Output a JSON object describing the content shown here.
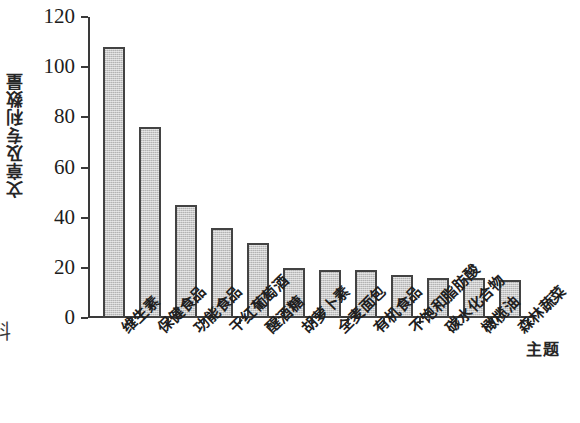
{
  "caption_fragment": "料",
  "chart_data": {
    "type": "bar",
    "title": "",
    "xlabel": "主题",
    "ylabel": "文章及专利数量",
    "ylim": [
      0,
      120
    ],
    "yticks": [
      0,
      20,
      40,
      60,
      80,
      100,
      120
    ],
    "ytick_labels": [
      "0",
      "20",
      "40",
      "60",
      "80",
      "100",
      "120"
    ],
    "grid": false,
    "legend": null,
    "bar_color": "#c9c9c9",
    "bar_edge_color": "#434343",
    "axis_color": "#3a3a3a",
    "categories": [
      "维生素",
      "保健食品",
      "功能食品",
      "干红葡萄酒",
      "醒酒糖",
      "胡萝卜素",
      "全麦面包",
      "有机食品",
      "不饱和脂肪酸",
      "碳水化合物",
      "橄榄油",
      "森林蔬菜"
    ],
    "values": [
      108,
      76,
      45,
      36,
      30,
      20,
      19,
      19,
      17,
      16,
      16,
      15
    ]
  }
}
